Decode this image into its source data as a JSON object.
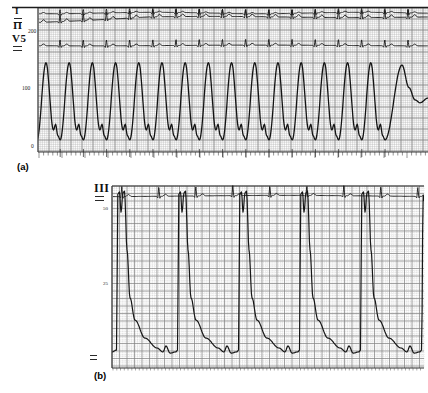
{
  "chart_data": [
    {
      "panel": "a",
      "panel_label": "(a)",
      "type": "line",
      "description": "Scanned strip-chart recording: ECG leads I, II, V5 with arterial pressure trace on ECG grid paper during rapid regular tachycardia",
      "lead_labels": [
        "I",
        "II",
        "V5"
      ],
      "y_axis": {
        "ticks": [
          "200",
          "100",
          "0"
        ],
        "values": [
          200,
          100,
          0
        ],
        "range": [
          0,
          200
        ],
        "grid": "fine ECG paper grid"
      },
      "pressure_trace": {
        "name": "arterial-pressure-wave",
        "systolic_mmHg": 147,
        "diastolic_mmHg": 14,
        "regular_beats": 15,
        "beat_period_px": 23.2,
        "first_peak_x": 46,
        "cycle_shape_phase_mmHg": [
          [
            0,
            14
          ],
          [
            0.388,
            147
          ],
          [
            0.71,
            31
          ],
          [
            0.8,
            41
          ],
          [
            0.9,
            21
          ],
          [
            1,
            14
          ]
        ],
        "final_beat_x_mmHg": [
          [
            385,
            14
          ],
          [
            402,
            143
          ],
          [
            409,
            104
          ],
          [
            415,
            83
          ],
          [
            420,
            78
          ],
          [
            428,
            86
          ]
        ],
        "note": "last beat prolonged with slow diastolic decay"
      },
      "ecg_traces": [
        {
          "name": "lead-I",
          "baseline_y": 13,
          "r_amp": 4.5,
          "t_amp": 1.2
        },
        {
          "name": "lead-II",
          "baseline_y": 22,
          "baseline_y_mid": 17,
          "r_amp": 8,
          "t_amp": 2.5
        },
        {
          "name": "lead-V5",
          "baseline_y": 45.5,
          "r_amp": 6.5,
          "t_amp": 1.8
        }
      ]
    },
    {
      "panel": "b",
      "panel_label": "(b)",
      "type": "line",
      "description": "Scanned strip-chart recording: ECG lead III with large-amplitude pressure trace, steep double-spiked upstrokes and slow diastolic decay",
      "lead_labels": [
        "III"
      ],
      "y_axis": {
        "ticks": [
          "50",
          "25"
        ],
        "values": [
          50,
          25
        ],
        "range": [
          0,
          60
        ]
      },
      "pressure_trace": {
        "name": "pressure-wave",
        "peak_units": 56,
        "trough_units": 2.7,
        "beats": 5,
        "beat_period_px": 61,
        "first_beat_x": 115,
        "beat_shape_dx_units": [
          [
            0,
            2.7
          ],
          [
            1.5,
            3.3
          ],
          [
            2.8,
            55.3
          ],
          [
            4.5,
            56
          ],
          [
            6,
            49.3
          ],
          [
            8,
            55.7
          ],
          [
            9.5,
            56.3
          ],
          [
            12,
            36.7
          ],
          [
            15,
            20.7
          ],
          [
            20,
            13.3
          ],
          [
            30,
            7.3
          ],
          [
            42,
            4
          ],
          [
            48,
            2.7
          ],
          [
            51,
            4.7
          ],
          [
            55,
            2.3
          ],
          [
            61,
            2.7
          ]
        ],
        "partial_last_beat": [
          [
            420,
            2.7
          ],
          [
            421.5,
            3.3
          ],
          [
            423.2,
            55
          ],
          [
            424.5,
            53
          ]
        ]
      },
      "ecg_trace": {
        "name": "lead-III",
        "baseline_y": 196,
        "r_amp": 10,
        "t_amp": 2,
        "period_px": 37,
        "first_r_x": 122
      }
    }
  ]
}
